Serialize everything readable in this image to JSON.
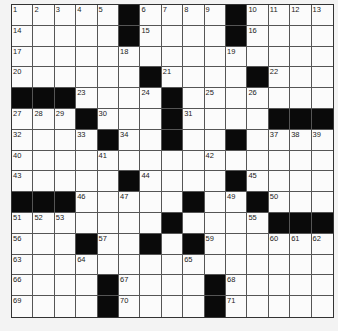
{
  "puzzle": {
    "rows": 15,
    "cols": 15,
    "layout": [
      "00000#0000#0000",
      "00000#0000#0000",
      "000000000000000",
      "000000#0000#000",
      "###0000#0000000",
      "000#000#0000###",
      "0000#00#00#0000",
      "000000000000000",
      "00000#0000#0000",
      "###00000#00#000",
      "0000000#0000###",
      "000#00#0#000000",
      "000000000000000",
      "0000#0000#00000",
      "0000#0000#00000"
    ],
    "numbers": [
      {
        "r": 0,
        "c": 0,
        "n": "1"
      },
      {
        "r": 0,
        "c": 1,
        "n": "2"
      },
      {
        "r": 0,
        "c": 2,
        "n": "3"
      },
      {
        "r": 0,
        "c": 3,
        "n": "4"
      },
      {
        "r": 0,
        "c": 4,
        "n": "5"
      },
      {
        "r": 0,
        "c": 6,
        "n": "6"
      },
      {
        "r": 0,
        "c": 7,
        "n": "7"
      },
      {
        "r": 0,
        "c": 8,
        "n": "8"
      },
      {
        "r": 0,
        "c": 9,
        "n": "9"
      },
      {
        "r": 0,
        "c": 11,
        "n": "10"
      },
      {
        "r": 0,
        "c": 12,
        "n": "11"
      },
      {
        "r": 0,
        "c": 13,
        "n": "12"
      },
      {
        "r": 0,
        "c": 14,
        "n": "13"
      },
      {
        "r": 1,
        "c": 0,
        "n": "14"
      },
      {
        "r": 1,
        "c": 6,
        "n": "15"
      },
      {
        "r": 1,
        "c": 11,
        "n": "16"
      },
      {
        "r": 2,
        "c": 0,
        "n": "17"
      },
      {
        "r": 2,
        "c": 5,
        "n": "18"
      },
      {
        "r": 2,
        "c": 10,
        "n": "19"
      },
      {
        "r": 3,
        "c": 0,
        "n": "20"
      },
      {
        "r": 3,
        "c": 7,
        "n": "21"
      },
      {
        "r": 3,
        "c": 12,
        "n": "22"
      },
      {
        "r": 4,
        "c": 3,
        "n": "23"
      },
      {
        "r": 4,
        "c": 6,
        "n": "24"
      },
      {
        "r": 4,
        "c": 9,
        "n": "25"
      },
      {
        "r": 4,
        "c": 11,
        "n": "26"
      },
      {
        "r": 5,
        "c": 0,
        "n": "27"
      },
      {
        "r": 5,
        "c": 1,
        "n": "28"
      },
      {
        "r": 5,
        "c": 2,
        "n": "29"
      },
      {
        "r": 5,
        "c": 4,
        "n": "30"
      },
      {
        "r": 5,
        "c": 8,
        "n": "31"
      },
      {
        "r": 6,
        "c": 0,
        "n": "32"
      },
      {
        "r": 6,
        "c": 3,
        "n": "33"
      },
      {
        "r": 6,
        "c": 5,
        "n": "34"
      },
      {
        "r": 6,
        "c": 7,
        "n": "35"
      },
      {
        "r": 6,
        "c": 10,
        "n": "36"
      },
      {
        "r": 6,
        "c": 12,
        "n": "37"
      },
      {
        "r": 6,
        "c": 13,
        "n": "38"
      },
      {
        "r": 6,
        "c": 14,
        "n": "39"
      },
      {
        "r": 7,
        "c": 0,
        "n": "40"
      },
      {
        "r": 7,
        "c": 4,
        "n": "41"
      },
      {
        "r": 7,
        "c": 9,
        "n": "42"
      },
      {
        "r": 8,
        "c": 0,
        "n": "43"
      },
      {
        "r": 8,
        "c": 6,
        "n": "44"
      },
      {
        "r": 8,
        "c": 11,
        "n": "45"
      },
      {
        "r": 9,
        "c": 3,
        "n": "46"
      },
      {
        "r": 9,
        "c": 5,
        "n": "47"
      },
      {
        "r": 9,
        "c": 8,
        "n": "48"
      },
      {
        "r": 9,
        "c": 10,
        "n": "49"
      },
      {
        "r": 9,
        "c": 12,
        "n": "50"
      },
      {
        "r": 10,
        "c": 0,
        "n": "51"
      },
      {
        "r": 10,
        "c": 1,
        "n": "52"
      },
      {
        "r": 10,
        "c": 2,
        "n": "53"
      },
      {
        "r": 10,
        "c": 7,
        "n": "54"
      },
      {
        "r": 10,
        "c": 11,
        "n": "55"
      },
      {
        "r": 11,
        "c": 0,
        "n": "56"
      },
      {
        "r": 11,
        "c": 4,
        "n": "57"
      },
      {
        "r": 11,
        "c": 6,
        "n": "58"
      },
      {
        "r": 11,
        "c": 9,
        "n": "59"
      },
      {
        "r": 11,
        "c": 12,
        "n": "60"
      },
      {
        "r": 11,
        "c": 13,
        "n": "61"
      },
      {
        "r": 11,
        "c": 14,
        "n": "62"
      },
      {
        "r": 12,
        "c": 0,
        "n": "63"
      },
      {
        "r": 12,
        "c": 3,
        "n": "64"
      },
      {
        "r": 12,
        "c": 8,
        "n": "65"
      },
      {
        "r": 13,
        "c": 0,
        "n": "66"
      },
      {
        "r": 13,
        "c": 5,
        "n": "67"
      },
      {
        "r": 13,
        "c": 10,
        "n": "68"
      },
      {
        "r": 14,
        "c": 0,
        "n": "69"
      },
      {
        "r": 14,
        "c": 5,
        "n": "70"
      },
      {
        "r": 14,
        "c": 10,
        "n": "71"
      }
    ]
  },
  "colors": {
    "black_square": "#0a0a0a",
    "white_square": "#fbfbfb",
    "grid_line": "#555555",
    "background": "#f3f3f3"
  }
}
